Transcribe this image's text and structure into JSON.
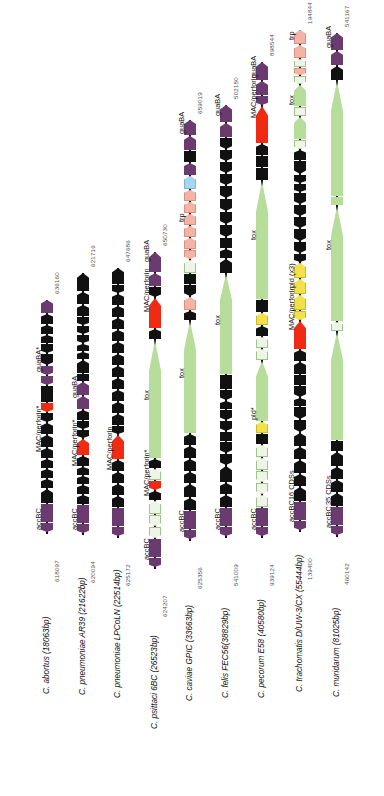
{
  "figure": {
    "type": "genome-comparison-diagram",
    "orientation": "vertical-tracks-rotated-labels",
    "colors": {
      "cds_generic": "#111111",
      "guaBA": "#6b3a6e",
      "MAC_perforin": "#ef2b14",
      "tox": "#b7dd9a",
      "pseudogene_pale": "#eef5e7",
      "trp": "#f4b3a4",
      "blue_cds": "#a8d5ef",
      "pld": "#f4e04a",
      "accBC": "#6b3a6e"
    },
    "legend_note": "Asterisk (*) marks pseudogenes / truncated loci."
  },
  "tracks": [
    {
      "id": "c-abortus",
      "species": "C. abortus (18063bp)",
      "coord_top": "636160",
      "coord_bottom": "618097",
      "labels": [
        "guaBA*",
        "MAC/perforin*",
        "accBC"
      ],
      "cds_count": null
    },
    {
      "id": "c-pneumoniae-ar39",
      "species": "C. pneumoniae AR39 (21622bp)",
      "coord_top": "621716",
      "coord_bottom": "620094",
      "labels": [
        "guaBA",
        "MAC/perforin*",
        "accBC"
      ],
      "cds_count": null
    },
    {
      "id": "c-pneumoniae-lpcoln",
      "species": "C. pneumoniae LPCoLN (22514bp)",
      "coord_top": "647686",
      "coord_bottom": "625172",
      "labels": [
        "MAC/perforin",
        "accBC"
      ],
      "cds_count": null
    },
    {
      "id": "c-psittaci-6bc",
      "species": "C. psittaci 6BC (26523bp)",
      "coord_top": "650730",
      "coord_bottom": "624207",
      "labels": [
        "guaBA",
        "MAC/perforin",
        "tox",
        "MAC/perforin*",
        "accBC"
      ],
      "cds_count": null
    },
    {
      "id": "c-caviae-gpic",
      "species": "C. caviae GPIC (33663bp)",
      "coord_top": "659019",
      "coord_bottom": "625356",
      "labels": [
        "guaBA",
        "trp",
        "tox",
        "accBC"
      ],
      "cds_count": null
    },
    {
      "id": "c-felis-fec56",
      "species": "C. felis FEC56(38829bp)",
      "coord_top": "502180",
      "coord_bottom": "541009",
      "labels": [
        "guaBA",
        "tox",
        "accBC"
      ],
      "cds_count": null
    },
    {
      "id": "c-pecorum-e58",
      "species": "C. pecorum E58 (40580bp)",
      "coord_top": "898544",
      "coord_bottom": "939124",
      "labels": [
        "guaBA",
        "MAC/perforin",
        "tox",
        "pld*",
        "accBC"
      ],
      "cds_count": null
    },
    {
      "id": "c-trachomatis-duw3cx",
      "species": "C. trachomatis D/UW-3/CX (55444bp)",
      "coord_top": "194844",
      "coord_bottom": "139400",
      "labels": [
        "trp",
        "tox",
        "pld (x3)",
        "MAC/perforin",
        "accBC"
      ],
      "cds_count": "16 CDSs"
    },
    {
      "id": "c-muridarum",
      "species": "C. muridarum (81025bp)",
      "coord_top": "541167",
      "coord_bottom": "460142",
      "labels": [
        "guaBA",
        "tox",
        "accBC"
      ],
      "cds_count": "35 CDSs"
    }
  ]
}
